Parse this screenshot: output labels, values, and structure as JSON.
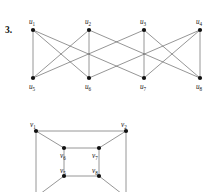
{
  "figure": {
    "problem_number": "3.",
    "background_color": "#ffffff",
    "edge_color": "#555555",
    "node_color": "#111111",
    "label_color": "#151515"
  },
  "graph_top": {
    "name": "bipartite-graph-u",
    "top_row_labels": [
      "u",
      "u",
      "u",
      "u"
    ],
    "top_row_subscripts": [
      "1",
      "2",
      "3",
      "4"
    ],
    "bottom_row_labels": [
      "u",
      "u",
      "u",
      "u"
    ],
    "bottom_row_subscripts": [
      "5",
      "6",
      "7",
      "8"
    ],
    "nodes": [
      {
        "id": "u1",
        "letter": "u",
        "sub": "1",
        "x": 33,
        "y": 30,
        "label_x": 29,
        "label_y": 24,
        "label_anchor": "start"
      },
      {
        "id": "u2",
        "letter": "u",
        "sub": "2",
        "x": 89,
        "y": 30,
        "label_x": 85,
        "label_y": 24,
        "label_anchor": "start"
      },
      {
        "id": "u3",
        "letter": "u",
        "sub": "3",
        "x": 144,
        "y": 30,
        "label_x": 140,
        "label_y": 24,
        "label_anchor": "start"
      },
      {
        "id": "u4",
        "letter": "u",
        "sub": "4",
        "x": 200,
        "y": 30,
        "label_x": 196,
        "label_y": 24,
        "label_anchor": "start"
      },
      {
        "id": "u5",
        "letter": "u",
        "sub": "5",
        "x": 33,
        "y": 78,
        "label_x": 29,
        "label_y": 89,
        "label_anchor": "start"
      },
      {
        "id": "u6",
        "letter": "u",
        "sub": "6",
        "x": 89,
        "y": 78,
        "label_x": 85,
        "label_y": 89,
        "label_anchor": "start"
      },
      {
        "id": "u7",
        "letter": "u",
        "sub": "7",
        "x": 144,
        "y": 78,
        "label_x": 140,
        "label_y": 89,
        "label_anchor": "start"
      },
      {
        "id": "u8",
        "letter": "u",
        "sub": "8",
        "x": 200,
        "y": 78,
        "label_x": 196,
        "label_y": 89,
        "label_anchor": "start"
      }
    ],
    "edges": [
      [
        "u1",
        "u5"
      ],
      [
        "u1",
        "u6"
      ],
      [
        "u1",
        "u7"
      ],
      [
        "u2",
        "u5"
      ],
      [
        "u2",
        "u6"
      ],
      [
        "u2",
        "u8"
      ],
      [
        "u3",
        "u5"
      ],
      [
        "u3",
        "u7"
      ],
      [
        "u3",
        "u8"
      ],
      [
        "u4",
        "u6"
      ],
      [
        "u4",
        "u7"
      ],
      [
        "u4",
        "u8"
      ]
    ]
  },
  "graph_bottom": {
    "name": "cube-graph-v",
    "outer_labels": [
      "v",
      "v"
    ],
    "outer_subscripts": [
      "1",
      "2"
    ],
    "inner_labels": [
      "v",
      "v",
      "v",
      "v"
    ],
    "inner_subscripts": [
      "6",
      "7",
      "5",
      "8"
    ],
    "nodes": [
      {
        "id": "v1",
        "letter": "v",
        "sub": "1",
        "x": 36,
        "y": 131,
        "label_x": 30,
        "label_y": 127,
        "label_anchor": "start"
      },
      {
        "id": "v2",
        "letter": "v",
        "sub": "2",
        "x": 126,
        "y": 131,
        "label_x": 121,
        "label_y": 127,
        "label_anchor": "start"
      },
      {
        "id": "v3",
        "letter": "v",
        "sub": "3",
        "x": 36,
        "y": 197,
        "label_x": 30,
        "label_y": 207,
        "label_anchor": "start"
      },
      {
        "id": "v4",
        "letter": "v",
        "sub": "4",
        "x": 126,
        "y": 197,
        "label_x": 121,
        "label_y": 207,
        "label_anchor": "start"
      },
      {
        "id": "v6",
        "letter": "v",
        "sub": "6",
        "x": 64,
        "y": 148,
        "label_x": 60,
        "label_y": 158,
        "label_anchor": "start"
      },
      {
        "id": "v7",
        "letter": "v",
        "sub": "7",
        "x": 99,
        "y": 148,
        "label_x": 92,
        "label_y": 158,
        "label_anchor": "start"
      },
      {
        "id": "v5",
        "letter": "v",
        "sub": "5",
        "x": 64,
        "y": 176,
        "label_x": 60,
        "label_y": 173,
        "label_anchor": "start"
      },
      {
        "id": "v8",
        "letter": "v",
        "sub": "8",
        "x": 99,
        "y": 176,
        "label_x": 92,
        "label_y": 173,
        "label_anchor": "start"
      }
    ],
    "edges": [
      [
        "v1",
        "v2"
      ],
      [
        "v1",
        "v3"
      ],
      [
        "v3",
        "v4"
      ],
      [
        "v2",
        "v4"
      ],
      [
        "v6",
        "v7"
      ],
      [
        "v6",
        "v5"
      ],
      [
        "v5",
        "v8"
      ],
      [
        "v7",
        "v8"
      ],
      [
        "v1",
        "v6"
      ],
      [
        "v2",
        "v7"
      ],
      [
        "v3",
        "v5"
      ],
      [
        "v4",
        "v8"
      ]
    ]
  }
}
